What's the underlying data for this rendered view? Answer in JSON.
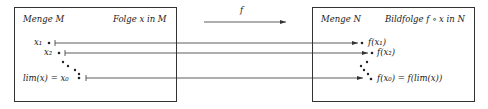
{
  "diagram": {
    "left_box": {
      "title": "Menge M",
      "subtitle": "Folge x in M",
      "points": [
        {
          "label": "x₁",
          "name": "x1"
        },
        {
          "label": "x₂",
          "name": "x2"
        },
        {
          "label": "lim(x) = x₀",
          "name": "limit"
        }
      ]
    },
    "mapping": {
      "label": "f"
    },
    "right_box": {
      "title": "Menge N",
      "subtitle": "Bildfolge f ∘ x in N",
      "points": [
        {
          "label": "f(x₁)",
          "name": "f-x1"
        },
        {
          "label": "f(x₂)",
          "name": "f-x2"
        },
        {
          "label": "f(x₀) = f(lim(x))",
          "name": "f-limit"
        }
      ]
    },
    "colors": {
      "stroke": "#333333",
      "text": "#1a1a1a",
      "background": "#ffffff"
    }
  }
}
